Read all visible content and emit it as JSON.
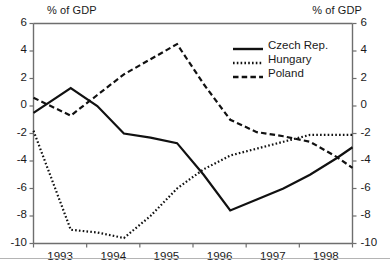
{
  "chart_data": {
    "type": "line",
    "title": "",
    "subtitle": "",
    "xlabel": "",
    "ylabel": "% of GDP",
    "ylabel_right": "% of GDP",
    "ylim": [
      -10,
      6
    ],
    "ytick_step": 2,
    "yticks": [
      6,
      4,
      2,
      0,
      -2,
      -4,
      -6,
      -8,
      -10
    ],
    "ytick_labels": [
      "6",
      "4",
      "2",
      "0",
      "-2",
      "-4",
      "-6",
      "-8",
      "-10"
    ],
    "ytick_labels_right": [
      "6",
      "4",
      "2",
      "0",
      "-2",
      "-4",
      "-6",
      "-8",
      "-10"
    ],
    "categories": [
      "1993",
      "1994",
      "1995",
      "1996",
      "1997",
      "1998"
    ],
    "xtick_labels": [
      "1993",
      "1994",
      "1995",
      "1996",
      "1997",
      "1998"
    ],
    "xlim": [
      1992.5,
      1998.5
    ],
    "grid": false,
    "legend_position": "upper right",
    "dual_axis": true,
    "series": [
      {
        "name": "Czech Rep.",
        "style": "solid",
        "color": "#111111",
        "x": [
          1992.5,
          1993.2,
          1993.7,
          1994.2,
          1994.7,
          1995.2,
          1995.7,
          1996.2,
          1996.7,
          1997.2,
          1997.7,
          1998.2,
          1998.5
        ],
        "values": [
          -0.5,
          1.3,
          0.0,
          -2.0,
          -2.3,
          -2.7,
          -5.0,
          -7.6,
          -6.8,
          -6.0,
          -5.0,
          -3.8,
          -3.0
        ]
      },
      {
        "name": "Hungary",
        "style": "dotted",
        "color": "#111111",
        "x": [
          1992.5,
          1993.2,
          1993.7,
          1994.2,
          1994.7,
          1995.2,
          1995.7,
          1996.2,
          1996.7,
          1997.2,
          1997.7,
          1998.2,
          1998.5
        ],
        "values": [
          -1.8,
          -9.0,
          -9.2,
          -9.6,
          -8.0,
          -6.0,
          -4.6,
          -3.6,
          -3.1,
          -2.6,
          -2.1,
          -2.1,
          -2.1
        ]
      },
      {
        "name": "Poland",
        "style": "dashed",
        "color": "#111111",
        "x": [
          1992.5,
          1993.2,
          1993.7,
          1994.2,
          1994.7,
          1995.2,
          1995.7,
          1996.2,
          1996.7,
          1997.2,
          1997.7,
          1998.2,
          1998.5
        ],
        "values": [
          0.6,
          -0.7,
          0.8,
          2.3,
          3.4,
          4.5,
          1.6,
          -1.0,
          -1.9,
          -2.2,
          -2.6,
          -3.7,
          -4.5
        ]
      }
    ]
  },
  "legend": {
    "items": [
      {
        "label": "Czech Rep."
      },
      {
        "label": "Hungary"
      },
      {
        "label": "Poland"
      }
    ]
  },
  "footer": {
    "note": ""
  }
}
